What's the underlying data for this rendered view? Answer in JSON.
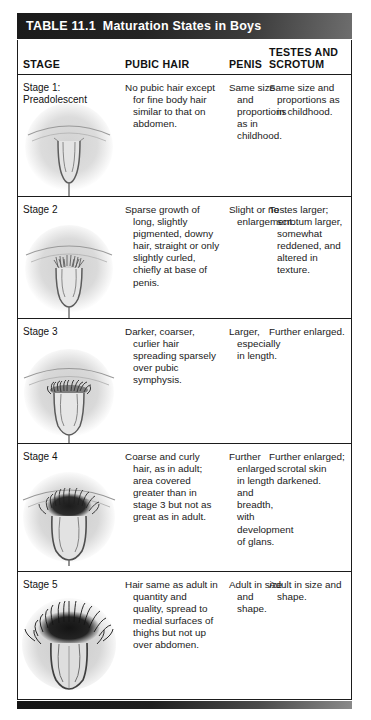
{
  "table": {
    "number": "TABLE 11.1",
    "title": "Maturation States in Boys",
    "columns": {
      "stage": "STAGE",
      "pubic_hair": "PUBIC HAIR",
      "penis": "PENIS",
      "testes_line1": "TESTES AND",
      "testes_line2": "SCROTUM"
    },
    "rows": [
      {
        "stage": "Stage 1: Preadolescent",
        "pubic_hair": "No pubic hair except for fine body hair similar to that on abdomen.",
        "penis": "Same size and proportions as in childhood.",
        "testes_and_scrotum": "Same size and proportions as in childhood.",
        "figure": "preadolescent-genitalia-illustration"
      },
      {
        "stage": "Stage 2",
        "pubic_hair": "Sparse growth of long, slightly pigmented, downy hair, straight or only slightly curled, chiefly at base of penis.",
        "penis": "Slight or no enlargement.",
        "testes_and_scrotum": "Testes larger; scrotum larger, somewhat reddened, and altered in texture.",
        "figure": "stage-2-genitalia-illustration"
      },
      {
        "stage": "Stage 3",
        "pubic_hair": "Darker, coarser, curlier hair spreading sparsely over pubic symphysis.",
        "penis": "Larger, especially in length.",
        "testes_and_scrotum": "Further enlarged.",
        "figure": "stage-3-genitalia-illustration"
      },
      {
        "stage": "Stage 4",
        "pubic_hair": "Coarse and curly hair, as in adult; area covered greater than in stage 3 but not as great as in adult.",
        "penis": "Further enlarged in length and breadth, with development of glans.",
        "testes_and_scrotum": "Further enlarged; scrotal skin darkened.",
        "figure": "stage-4-genitalia-illustration"
      },
      {
        "stage": "Stage 5",
        "pubic_hair": "Hair same as adult in quantity and quality, spread to medial surfaces of thighs but not up over abdomen.",
        "penis": "Adult in size and shape.",
        "testes_and_scrotum": "Adult in size and shape.",
        "figure": "stage-5-genitalia-illustration"
      }
    ]
  },
  "colors": {
    "title_bar_dark": "#1a1a1a",
    "title_bar_light": "#6e6e6e",
    "border": "#1b1b1b",
    "text": "#1a1a1a",
    "background": "#ffffff"
  }
}
